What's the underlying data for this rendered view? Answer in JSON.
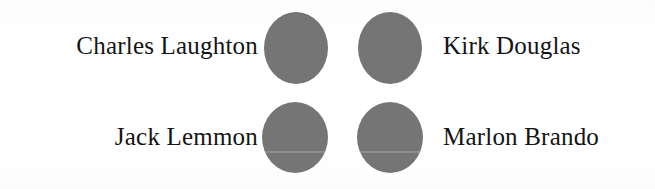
{
  "page": {
    "type": "matching-quiz-figure",
    "background_color": "#ffffff",
    "text_color": "#141414"
  },
  "items": [
    {
      "id": "charles-laughton",
      "label": "Charles Laughton",
      "column": "left",
      "row": "top"
    },
    {
      "id": "kirk-douglas",
      "label": "Kirk Douglas",
      "column": "right",
      "row": "top"
    },
    {
      "id": "jack-lemmon",
      "label": "Jack Lemmon",
      "column": "left",
      "row": "bottom"
    },
    {
      "id": "marlon-brando",
      "label": "Marlon Brando",
      "column": "right",
      "row": "bottom"
    }
  ],
  "bubbles": [
    {
      "id": "bubble-top-left",
      "row": "top",
      "column": "left",
      "fill": "#757575",
      "shape": "ellipse",
      "selected": false
    },
    {
      "id": "bubble-top-right",
      "row": "top",
      "column": "right",
      "fill": "#757575",
      "shape": "ellipse",
      "selected": false
    },
    {
      "id": "bubble-bottom-left",
      "row": "bottom",
      "column": "left",
      "fill": "#757575",
      "shape": "ellipse",
      "selected": false
    },
    {
      "id": "bubble-bottom-right",
      "row": "bottom",
      "column": "right",
      "fill": "#757575",
      "shape": "ellipse",
      "selected": false
    }
  ]
}
